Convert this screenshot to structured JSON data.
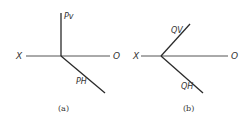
{
  "figures": [
    {
      "id": "a",
      "caption": "(a)",
      "axis_left_label": "X",
      "axis_right_label": "O",
      "trace_upper_label": "Pv",
      "trace_lower_label": "PH"
    },
    {
      "id": "b",
      "caption": "(b)",
      "axis_left_label": "X",
      "axis_right_label": "O",
      "trace_upper_label": "QV",
      "trace_lower_label": "QH"
    }
  ],
  "colors": {
    "line": "#2a2a2a",
    "text": "#333333",
    "background": "#ffffff"
  }
}
